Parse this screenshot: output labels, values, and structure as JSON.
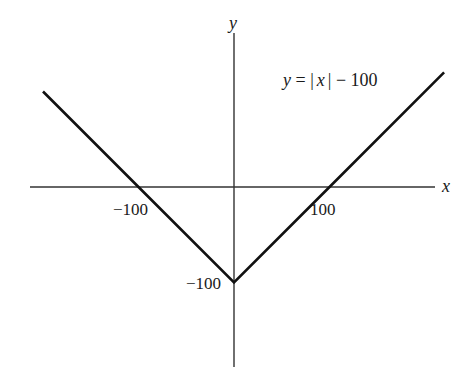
{
  "chart_data": {
    "type": "line",
    "title": "",
    "function_label": "y = |x| − 100",
    "xlabel": "x",
    "ylabel": "y",
    "x_ticks": [
      -100,
      100
    ],
    "x_tick_labels": [
      "−100",
      "100"
    ],
    "y_ticks": [
      -100
    ],
    "y_tick_labels": [
      "−100"
    ],
    "grid": false,
    "legend": null,
    "series": [
      {
        "name": "y = |x| − 100",
        "x": [
          -200,
          -100,
          0,
          100,
          220
        ],
        "y": [
          100,
          0,
          -100,
          0,
          120
        ]
      }
    ],
    "xlim": [
      -215,
      215
    ],
    "ylim": [
      -180,
      160
    ],
    "colors": {
      "line": "#111111",
      "axes": "#333333",
      "background": "#ffffff"
    }
  },
  "labels": {
    "y_axis": "y",
    "x_axis": "x",
    "eq_y": "y",
    "eq_equals": "=",
    "eq_abs_open": "|",
    "eq_x": "x",
    "eq_abs_close": "|",
    "eq_rest": "− 100",
    "tick_neg100_x": "−100",
    "tick_100_x": "100",
    "tick_neg100_y": "−100"
  }
}
